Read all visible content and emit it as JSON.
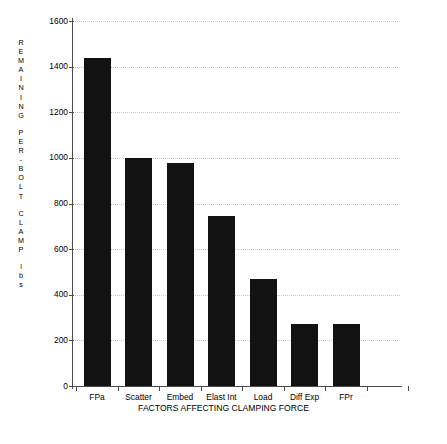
{
  "chart_data": {
    "type": "bar",
    "title": "",
    "subtitle": "",
    "xlabel": "FACTORS AFFECTING CLAMPING FORCE",
    "ylabel": "REMAINING PER-BOLT CLAMP lbs",
    "ylabel_lines": [
      "REMAINING",
      "PER-BOLT",
      "CLAMP",
      "lbs"
    ],
    "categories": [
      "FPa",
      "Scatter",
      "Embed",
      "Elast Int",
      "Load",
      "Diff Exp",
      "FPr"
    ],
    "values": [
      1440,
      1000,
      978,
      745,
      468,
      270,
      270
    ],
    "ylim": [
      0,
      1600
    ],
    "yticks": [
      0,
      200,
      400,
      600,
      800,
      1000,
      1200,
      1400,
      1600
    ],
    "ytick_labels": [
      "0",
      "200",
      "400",
      "600",
      "800",
      "1000",
      "1200",
      "1400",
      "1600"
    ],
    "grid": true,
    "grid_axis": "y",
    "legend": false,
    "legend_position": "none",
    "bar_color": "#121212",
    "grid_color": "#c9c9c9",
    "axis_color": "#4a4a4a",
    "background_color": "#ffffff"
  }
}
